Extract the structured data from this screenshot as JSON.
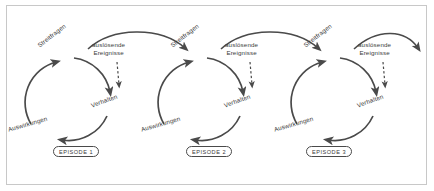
{
  "figure": {
    "title_visible": false,
    "background_color": "#ffffff",
    "frame_color": "#c8c8c8",
    "stroke_color": "#4a4a4a",
    "text_color": "#3b3b3b"
  },
  "diagram_data": {
    "type": "cycle-diagram",
    "cycle_count": 3,
    "cycle_direction": "clockwise",
    "node_labels": [
      "Streitfragen",
      "Verhalten",
      "Auswirkungen"
    ],
    "trigger_label_line1": "auslösende",
    "trigger_label_line2": "Ereignisse",
    "trigger_arrow_style": "dashed",
    "episodes": [
      {
        "label": "EPISODE 1"
      },
      {
        "label": "EPISODE 2"
      },
      {
        "label": "EPISODE 3"
      }
    ],
    "cycles": [
      {
        "index": 1,
        "episode": "EPISODE 1",
        "nodes": [
          {
            "name": "Streitfragen",
            "label": "Streitfragen",
            "rotation": -38
          },
          {
            "name": "Verhalten",
            "label": "Verhalten",
            "rotation": -20
          },
          {
            "name": "Auswirkungen",
            "label": "Auswirkungen",
            "rotation": -16
          }
        ],
        "trigger": {
          "line1": "auslösende",
          "line2": "Ereignisse"
        }
      },
      {
        "index": 2,
        "episode": "EPISODE 2",
        "nodes": [
          {
            "name": "Streitfragen",
            "label": "Streitfragen",
            "rotation": -38
          },
          {
            "name": "Verhalten",
            "label": "Verhalten",
            "rotation": -20
          },
          {
            "name": "Auswirkungen",
            "label": "Auswirkungen",
            "rotation": -16
          }
        ],
        "trigger": {
          "line1": "auslösende",
          "line2": "Ereignisse"
        }
      },
      {
        "index": 3,
        "episode": "EPISODE 3",
        "nodes": [
          {
            "name": "Streitfragen",
            "label": "Streitfragen",
            "rotation": -38
          },
          {
            "name": "Verhalten",
            "label": "Verhalten",
            "rotation": -20
          },
          {
            "name": "Auswirkungen",
            "label": "Auswirkungen",
            "rotation": -16
          }
        ],
        "trigger": {
          "line1": "auslösende",
          "line2": "Ereignisse"
        }
      }
    ]
  }
}
